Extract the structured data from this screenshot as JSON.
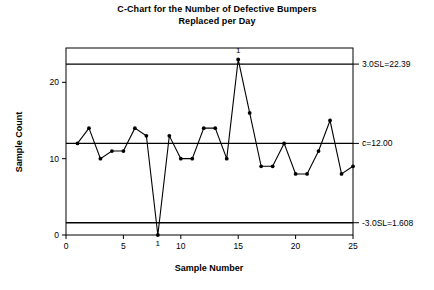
{
  "chart_data": {
    "type": "line",
    "title": "C-Chart for the Number of Defective Bumpers Replaced per Day",
    "title_line1": "C-Chart for the Number of Defective Bumpers",
    "title_line2": "Replaced per Day",
    "xlabel": "Sample Number",
    "ylabel": "Sample Count",
    "x": [
      1,
      2,
      3,
      4,
      5,
      6,
      7,
      8,
      9,
      10,
      11,
      12,
      13,
      14,
      15,
      16,
      17,
      18,
      19,
      20,
      21,
      22,
      23,
      24,
      25
    ],
    "values": [
      12,
      14,
      10,
      11,
      11,
      14,
      13,
      0,
      13,
      10,
      10,
      14,
      14,
      10,
      23,
      16,
      9,
      9,
      12,
      8,
      8,
      11,
      15,
      8,
      9
    ],
    "series": [
      {
        "name": "Sample Count",
        "values": [
          12,
          14,
          10,
          11,
          11,
          14,
          13,
          0,
          13,
          10,
          10,
          14,
          14,
          10,
          23,
          16,
          9,
          9,
          12,
          8,
          8,
          11,
          15,
          8,
          9
        ]
      }
    ],
    "xlim": [
      0,
      25
    ],
    "ylim": [
      0,
      24.5
    ],
    "xticks": [
      0,
      5,
      10,
      15,
      20,
      25
    ],
    "xtick_labels": [
      "0",
      "5",
      "10",
      "15",
      "20",
      "25"
    ],
    "yticks": [
      0,
      10,
      20
    ],
    "ytick_labels": [
      "0",
      "10",
      "20"
    ],
    "grid": false,
    "legend": false,
    "control_limits": {
      "ucl": {
        "value": 22.39,
        "label": "3.0SL=22.39"
      },
      "center": {
        "value": 12.0,
        "label": "c̄=12.00"
      },
      "lcl": {
        "value": 1.608,
        "label": "-3.0SL=1.608"
      }
    },
    "annotations": [
      {
        "text": "1",
        "x": 15,
        "y": 23,
        "position": "above",
        "note": "out-of-control point above UCL"
      },
      {
        "text": "1",
        "x": 8,
        "y": 0,
        "position": "below",
        "note": "out-of-control point below LCL"
      }
    ],
    "marker": "filled-circle",
    "line_color": "#000000",
    "marker_color": "#000000",
    "limit_line_color": "#000000",
    "background_color": "#ffffff"
  }
}
